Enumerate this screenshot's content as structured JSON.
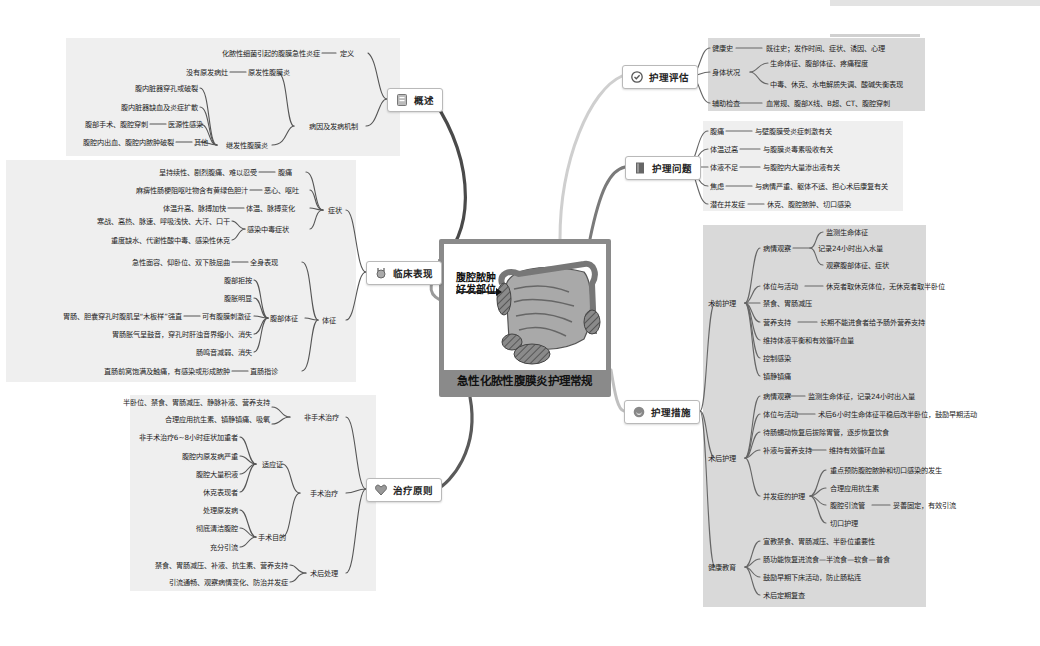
{
  "center": {
    "title": "急性化脓性腹膜炎护理常规",
    "image_label_line1": "腹腔脓肿",
    "image_label_line2": "好发部位",
    "frame_color": "#8a8a8a"
  },
  "colors": {
    "branch_overview": "#4a4a4a",
    "branch_clinical": "#9a9a9a",
    "branch_treatment": "#5a5a5a",
    "branch_assessment": "#c8c8c8",
    "branch_problems": "#7a7a7a",
    "branch_measures": "#b5b5b5",
    "panel_light": "#efefef",
    "panel_dark": "#d9d9d9"
  },
  "overview": {
    "topic": "概述",
    "icon": "document-icon",
    "definition": {
      "label": "定义",
      "text": "化脓性细菌引起的腹膜急性炎症"
    },
    "etiology": {
      "label": "病因及发病机制",
      "primary": {
        "label": "原发性腹膜炎",
        "text": "没有原发病灶"
      },
      "secondary": {
        "label": "继发性腹膜炎",
        "items": [
          "腹内脏器穿孔或破裂",
          "腹内脏器缺血及炎症扩散"
        ],
        "iatrogenic": {
          "label": "医源性感染",
          "text": "腹部手术、腹腔穿刺"
        },
        "other": {
          "label": "其他",
          "text": "腹腔内出血、腹腔内脓肿破裂"
        }
      }
    }
  },
  "clinical": {
    "topic": "临床表现",
    "icon": "stethoscope-icon",
    "symptoms": {
      "label": "症状",
      "pain": {
        "label": "腹痛",
        "text": "呈持续性、剧烈腹痛、难以忍受"
      },
      "nausea": {
        "label": "恶心、呕吐",
        "text": "麻痹性肠梗阻呕吐物含有黄绿色胆汁"
      },
      "temp": {
        "label": "体温、脉搏变化",
        "text": "体温升高、脉搏加快"
      },
      "toxic": {
        "label": "感染中毒症状",
        "items": [
          "寒战、高热、脉速、呼吸浅快、大汗、口干",
          "重度缺水、代谢性酸中毒、感染性休克"
        ]
      }
    },
    "signs": {
      "label": "体征",
      "general": {
        "label": "全身表现",
        "text": "急性面容、仰卧位、双下肢屈曲"
      },
      "abdominal": {
        "label": "腹部体征",
        "items": [
          "腹部拒按",
          "腹胀明显"
        ],
        "irritation": {
          "label": "可有腹膜刺激征",
          "text": "胃肠、胆囊穿孔时腹肌呈“木板样”强直"
        },
        "items2": [
          "胃肠胀气呈鼓音，穿孔时肝浊音界缩小、消失",
          "肠鸣音减弱、消失"
        ]
      },
      "rectal": {
        "label": "直肠指诊",
        "text": "直肠前窝饱满及触痛，有感染或形成脓肿"
      }
    }
  },
  "treatment": {
    "topic": "治疗原则",
    "icon": "heart-icon",
    "nonsurgical": {
      "label": "非手术治疗",
      "items": [
        "半卧位、禁食、胃肠减压、静脉补液、营养支持",
        "合理应用抗生素、镇静镇痛、吸氧"
      ]
    },
    "surgical": {
      "label": "手术治疗",
      "indications": {
        "label": "适应证",
        "items": [
          "非手术治疗6~8小时症状加重者",
          "腹腔内原发病严重",
          "腹腔大量积液",
          "休克表现者"
        ]
      },
      "goals": {
        "label": "手术目的",
        "items": [
          "处理原发病",
          "彻底清洁腹腔",
          "充分引流"
        ]
      }
    },
    "postop": {
      "label": "术后处理",
      "items": [
        "禁食、胃肠减压、补液、抗生素、营养支持",
        "引流通畅、观察病情变化、防治并发症"
      ]
    }
  },
  "assessment": {
    "topic": "护理评估",
    "icon": "check-circle-icon",
    "rows": [
      {
        "label": "健康史",
        "items": [
          "既往史；发作时间、症状、诱因、心理"
        ]
      },
      {
        "label": "身体状况",
        "items": [
          "生命体征、腹部体征、疼痛程度",
          "中毒、休克、水电解质失调、酸碱失衡表现"
        ]
      },
      {
        "label": "辅助检查",
        "items": [
          "血常规、腹部X线、B超、CT、腹腔穿刺"
        ]
      }
    ]
  },
  "problems": {
    "topic": "护理问题",
    "icon": "book-icon",
    "rows": [
      {
        "label": "腹痛",
        "text": "与壁腹膜受炎症刺激有关"
      },
      {
        "label": "体温过高",
        "text": "与腹膜炎毒素吸收有关"
      },
      {
        "label": "体液不足",
        "text": "与腹腔内大量渗出液有关"
      },
      {
        "label": "焦虑",
        "text": "与病情严重、躯体不适、担心术后康复有关"
      },
      {
        "label": "潜在并发症",
        "text": "休克、腹腔脓肿、切口感染"
      }
    ]
  },
  "measures": {
    "topic": "护理措施",
    "icon": "smile-icon",
    "preop": {
      "label": "术前护理",
      "observation": {
        "label": "病情观察",
        "items": [
          "监测生命体征",
          "记录24小时出入水量",
          "观察腹部体征、症状"
        ]
      },
      "position": {
        "label": "体位与活动",
        "text": "休克者取休克体位，无休克者取半卧位"
      },
      "fasting": "禁食、胃肠减压",
      "nutrition": {
        "label": "营养支持",
        "text": "长期不能进食者给予肠外营养支持"
      },
      "fluid": "维持体液平衡和有效循环血量",
      "infection": "控制感染",
      "analgesia": "镇静镇痛"
    },
    "postop": {
      "label": "术后护理",
      "observation": {
        "label": "病情观察",
        "text": "监测生命体征，记录24小时出入量"
      },
      "position": {
        "label": "体位与活动",
        "text": "术后6小时生命体征平稳后改半卧位，鼓励早期活动"
      },
      "diet": "待肠蠕动恢复后拔除胃管，逐步恢复饮食",
      "fluid": {
        "label": "补液与营养支持",
        "text": "维持有效循环血量"
      },
      "complications": {
        "label": "并发症的护理",
        "items": [
          "重点预防腹腔脓肿和切口感染的发生",
          "合理应用抗生素"
        ],
        "drain": {
          "label": "腹腔引流管",
          "text": "妥善固定，有效引流"
        },
        "incision": "切口护理"
      }
    },
    "education": {
      "label": "健康教育",
      "items": [
        "宣教禁食、胃肠减压、半卧位重要性",
        "肠功能恢复进流食—半流食—软食—普食",
        "鼓励早期下床活动，防止肠粘连",
        "术后定期复查"
      ]
    }
  }
}
